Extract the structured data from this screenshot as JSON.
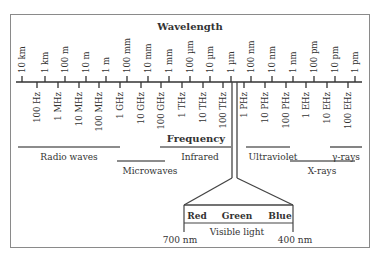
{
  "diagram": {
    "title": "Wavelength",
    "frequency_label": "Frequency",
    "wavelength_ticks": [
      {
        "label": "10 km",
        "x": 22
      },
      {
        "label": "1 km",
        "x": 45
      },
      {
        "label": "100 m",
        "x": 65
      },
      {
        "label": "10 m",
        "x": 86
      },
      {
        "label": "1 m",
        "x": 106
      },
      {
        "label": "100 mm",
        "x": 127
      },
      {
        "label": "10 mm",
        "x": 148
      },
      {
        "label": "1 mm",
        "x": 169
      },
      {
        "label": "100 µm",
        "x": 190
      },
      {
        "label": "10 µm",
        "x": 210
      },
      {
        "label": "1 µm",
        "x": 231
      },
      {
        "label": "100 nm",
        "x": 251
      },
      {
        "label": "10 nm",
        "x": 272
      },
      {
        "label": "1 nm",
        "x": 293
      },
      {
        "label": "100 pm",
        "x": 314
      },
      {
        "label": "10 pm",
        "x": 335
      },
      {
        "label": "1 pm",
        "x": 355
      }
    ],
    "frequency_ticks": [
      {
        "label": "100 Hz",
        "x": 37
      },
      {
        "label": "1 MHz",
        "x": 58
      },
      {
        "label": "10 MHz",
        "x": 79
      },
      {
        "label": "100 MHz",
        "x": 99
      },
      {
        "label": "1 GHz",
        "x": 120
      },
      {
        "label": "10 GHz",
        "x": 141
      },
      {
        "label": "100 GHz",
        "x": 161
      },
      {
        "label": "1 THz",
        "x": 182
      },
      {
        "label": "10 THz",
        "x": 203
      },
      {
        "label": "100 THz",
        "x": 223
      },
      {
        "label": "1 PHz",
        "x": 244
      },
      {
        "label": "10 PHz",
        "x": 265
      },
      {
        "label": "100 PHz",
        "x": 286
      },
      {
        "label": "1 EHz",
        "x": 306
      },
      {
        "label": "10 EHz",
        "x": 327
      },
      {
        "label": "100 EHz",
        "x": 348
      }
    ],
    "bands": [
      {
        "name": "Radio waves",
        "x1": 18,
        "x2": 120,
        "y": 147,
        "label_x": 69,
        "label_y": 160
      },
      {
        "name": "Microwaves",
        "x1": 117,
        "x2": 165,
        "y": 161,
        "label_x": 150,
        "label_y": 174
      },
      {
        "name": "Infrared",
        "x1": 160,
        "x2": 231,
        "y": 147,
        "label_x": 200,
        "label_y": 160
      },
      {
        "name": "Ultraviolet",
        "x1": 246,
        "x2": 290,
        "y": 147,
        "label_x": 273,
        "label_y": 160
      },
      {
        "name": "X-rays",
        "x1": 290,
        "x2": 355,
        "y": 161,
        "label_x": 322,
        "label_y": 174
      },
      {
        "name": "γ-rays",
        "x1": 330,
        "x2": 362,
        "y": 147,
        "label_x": 346,
        "label_y": 160
      }
    ],
    "visible": {
      "colors": [
        "Red",
        "Green",
        "Blue"
      ],
      "label": "Visible light",
      "left_wavelength": "700 nm",
      "right_wavelength": "400 nm"
    }
  }
}
